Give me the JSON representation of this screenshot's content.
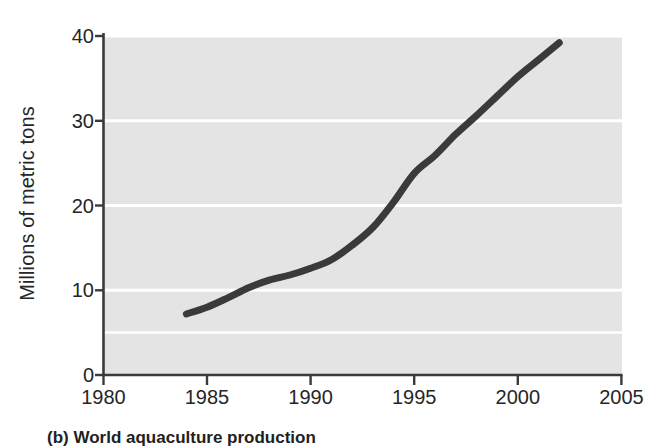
{
  "figure": {
    "caption": "(b) World aquaculture production",
    "background_color": "#ffffff",
    "plot_background_color": "#e3e3e3",
    "gridline_color": "#ffffff",
    "axis_color": "#3a3a3a",
    "line_color": "#3a3a3a"
  },
  "chart_data": {
    "type": "line",
    "title": "(b) World aquaculture production",
    "xlabel": "",
    "ylabel": "Millions of metric tons",
    "xlim": [
      1980,
      2005
    ],
    "ylim": [
      0,
      40
    ],
    "xticks": [
      1980,
      1985,
      1990,
      1995,
      2000,
      2005
    ],
    "xtick_labels": [
      "1980",
      "1985",
      "1990",
      "1995",
      "2000",
      "2005"
    ],
    "yticks": [
      0,
      10,
      20,
      30,
      40
    ],
    "ytick_labels": [
      "0",
      "10",
      "20",
      "30",
      "40"
    ],
    "grid": "horizontal",
    "legend": "none",
    "series": [
      {
        "name": "World aquaculture production",
        "x": [
          1984,
          1985,
          1986,
          1987,
          1988,
          1989,
          1990,
          1991,
          1992,
          1993,
          1994,
          1995,
          1996,
          1997,
          1998,
          1999,
          2000,
          2001,
          2002
        ],
        "values": [
          7.2,
          8.0,
          9.1,
          10.3,
          11.2,
          11.8,
          12.6,
          13.6,
          15.3,
          17.4,
          20.4,
          23.8,
          25.9,
          28.4,
          30.6,
          32.9,
          35.2,
          37.2,
          39.2
        ]
      }
    ]
  },
  "axes": {
    "y_title": "Millions of metric tons",
    "y_tick_labels": [
      "40",
      "30",
      "20",
      "10",
      "0"
    ],
    "x_tick_labels": [
      "1980",
      "1985",
      "1990",
      "1995",
      "2000",
      "2005"
    ]
  }
}
